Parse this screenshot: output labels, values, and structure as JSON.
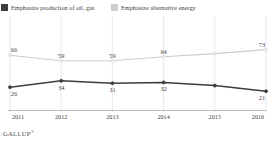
{
  "legend": {
    "items": [
      {
        "label": "Emphasize production of oil, gas",
        "color": "#3d3d3d",
        "swatch_name": "legend-swatch-oil-gas"
      },
      {
        "label": "Emphasize alternative energy",
        "color": "#cdcdcd",
        "swatch_name": "legend-swatch-alternative-energy"
      }
    ]
  },
  "source": {
    "name": "GALLUP",
    "mark": "®"
  },
  "chart_data": {
    "type": "line",
    "title": "",
    "xlabel": "",
    "ylabel": "",
    "categories": [
      "2011",
      "2012",
      "2013",
      "2014",
      "2015",
      "2016"
    ],
    "ylim": [
      0,
      100
    ],
    "grid": "vertical",
    "legend_position": "top",
    "series": [
      {
        "name": "Emphasize alternative energy",
        "color": "#cdcdcd",
        "values": [
          66,
          59,
          59,
          64,
          68,
          73
        ],
        "labels": [
          "66",
          "59",
          "59",
          "64",
          "",
          "73"
        ]
      },
      {
        "name": "Emphasize production of oil, gas",
        "color": "#3d3d3d",
        "values": [
          26,
          34,
          31,
          32,
          28,
          21
        ],
        "labels": [
          "26",
          "34",
          "31",
          "32",
          "",
          "21"
        ]
      }
    ]
  }
}
